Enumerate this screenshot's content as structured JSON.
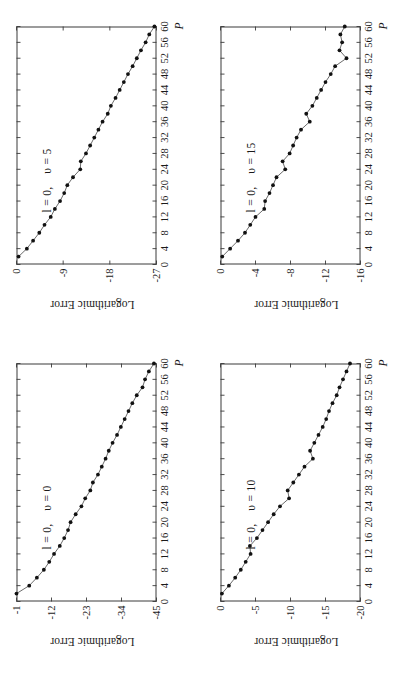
{
  "figure": {
    "orientation": "rotated-90-ccw",
    "panel_count": 4
  },
  "axis": {
    "ylabel": "Logarithmic Error",
    "xlabel": "P",
    "xticks": [
      "0",
      "4",
      "8",
      "12",
      "16",
      "20",
      "24",
      "28",
      "32",
      "36",
      "40",
      "44",
      "48",
      "52",
      "56",
      "60"
    ]
  },
  "chart_data": [
    {
      "type": "line",
      "title": "l = 0,   υ = 0",
      "annotation_l": "l = 0,",
      "annotation_v": "υ = 0",
      "xlabel": "P",
      "ylabel": "Logarithmic Error",
      "xlim": [
        0,
        60
      ],
      "ylim": [
        -45,
        -1
      ],
      "xticks": [
        0,
        4,
        8,
        12,
        16,
        20,
        24,
        28,
        32,
        36,
        40,
        44,
        48,
        52,
        56,
        60
      ],
      "yticks": [
        -1,
        -12,
        -23,
        -34,
        -45
      ],
      "ytick_labels": [
        "-1",
        "-12",
        "-23",
        "-34",
        "-45"
      ],
      "grid": false,
      "legend": "none",
      "markers": true,
      "x": [
        2,
        4,
        6,
        8,
        10,
        12,
        14,
        16,
        18,
        20,
        22,
        24,
        26,
        28,
        30,
        32,
        34,
        36,
        38,
        40,
        42,
        44,
        46,
        48,
        50,
        52,
        54,
        56,
        58,
        60
      ],
      "y": [
        -1.0,
        -5.0,
        -7.4,
        -9.6,
        -11.3,
        -12.8,
        -14.6,
        -16.0,
        -17.2,
        -18.0,
        -19.6,
        -21.4,
        -22.6,
        -24.2,
        -25.0,
        -26.6,
        -27.8,
        -29.0,
        -30.0,
        -31.2,
        -32.6,
        -33.8,
        -35.0,
        -36.2,
        -37.4,
        -38.8,
        -40.6,
        -41.4,
        -42.6,
        -44.2
      ]
    },
    {
      "type": "line",
      "title": "l = 0,   υ = 5",
      "annotation_l": "l = 0,",
      "annotation_v": "υ = 5",
      "xlabel": "P",
      "ylabel": "Logarithmic Error",
      "xlim": [
        0,
        60
      ],
      "ylim": [
        -27,
        0
      ],
      "xticks": [
        0,
        4,
        8,
        12,
        16,
        20,
        24,
        28,
        32,
        36,
        40,
        44,
        48,
        52,
        56,
        60
      ],
      "yticks": [
        0,
        -9,
        -18,
        -27
      ],
      "ytick_labels": [
        "0",
        "-9",
        "-18",
        "-27"
      ],
      "grid": false,
      "legend": "none",
      "markers": true,
      "x": [
        2,
        4,
        6,
        8,
        10,
        12,
        14,
        16,
        18,
        20,
        22,
        24,
        26,
        28,
        30,
        32,
        34,
        36,
        38,
        40,
        42,
        44,
        46,
        48,
        50,
        52,
        54,
        56,
        58,
        60
      ],
      "y": [
        -0.4,
        -2.0,
        -3.2,
        -4.4,
        -5.4,
        -6.6,
        -7.4,
        -8.4,
        -9.2,
        -9.8,
        -10.9,
        -12.3,
        -12.4,
        -13.4,
        -14.2,
        -15.0,
        -15.8,
        -16.6,
        -17.6,
        -18.2,
        -19.1,
        -19.9,
        -20.7,
        -21.5,
        -22.4,
        -23.2,
        -24.0,
        -24.9,
        -25.6,
        -26.6
      ]
    },
    {
      "type": "line",
      "title": "l = 0,   υ = 10",
      "annotation_l": "l = 0,",
      "annotation_v": "υ = 10",
      "xlabel": "P",
      "ylabel": "Logarithmic Error",
      "xlim": [
        0,
        60
      ],
      "ylim": [
        -20,
        0
      ],
      "xticks": [
        0,
        4,
        8,
        12,
        16,
        20,
        24,
        28,
        32,
        36,
        40,
        44,
        48,
        52,
        56,
        60
      ],
      "yticks": [
        0,
        -5,
        -10,
        -15,
        -20
      ],
      "ytick_labels": [
        "0",
        "-5",
        "-10",
        "-15",
        "-20"
      ],
      "grid": false,
      "legend": "none",
      "markers": true,
      "x": [
        2,
        4,
        6,
        8,
        10,
        12,
        14,
        16,
        18,
        20,
        22,
        24,
        26,
        28,
        30,
        32,
        34,
        36,
        38,
        40,
        42,
        44,
        46,
        48,
        50,
        52,
        54,
        56,
        58,
        60
      ],
      "y": [
        -0.2,
        -1.2,
        -2.1,
        -2.9,
        -3.6,
        -4.3,
        -4.2,
        -5.2,
        -6.0,
        -6.8,
        -7.6,
        -8.5,
        -9.8,
        -9.6,
        -10.4,
        -11.2,
        -12.0,
        -13.2,
        -12.8,
        -13.4,
        -14.0,
        -14.6,
        -15.1,
        -15.5,
        -16.0,
        -16.6,
        -17.0,
        -17.5,
        -18.0,
        -18.5
      ]
    },
    {
      "type": "line",
      "title": "l = 0,   υ = 15",
      "annotation_l": "l = 0,",
      "annotation_v": "υ = 15",
      "xlabel": "P",
      "ylabel": "Logarithmic Error",
      "xlim": [
        0,
        60
      ],
      "ylim": [
        -16,
        0
      ],
      "xticks": [
        0,
        4,
        8,
        12,
        16,
        20,
        24,
        28,
        32,
        36,
        40,
        44,
        48,
        52,
        56,
        60
      ],
      "yticks": [
        0,
        -4,
        -8,
        -12,
        -16
      ],
      "ytick_labels": [
        "0",
        "-4",
        "-8",
        "-12",
        "-16"
      ],
      "grid": false,
      "legend": "none",
      "markers": true,
      "x": [
        2,
        4,
        6,
        8,
        10,
        12,
        14,
        16,
        18,
        20,
        22,
        24,
        26,
        28,
        30,
        32,
        34,
        36,
        38,
        40,
        42,
        44,
        46,
        48,
        50,
        52,
        54,
        56,
        58,
        60
      ],
      "y": [
        -0.2,
        -1.1,
        -2.0,
        -2.8,
        -3.4,
        -4.0,
        -5.0,
        -5.1,
        -5.6,
        -6.0,
        -6.4,
        -7.4,
        -7.1,
        -7.9,
        -8.3,
        -8.7,
        -9.2,
        -10.2,
        -9.8,
        -10.5,
        -11.0,
        -11.5,
        -12.0,
        -12.6,
        -13.1,
        -14.4,
        -13.6,
        -13.9,
        -13.7,
        -14.2
      ]
    }
  ],
  "colors": {
    "line": "#5a5a5a",
    "marker": "#111111",
    "axis": "#3a3a3a",
    "background": "#ffffff"
  }
}
